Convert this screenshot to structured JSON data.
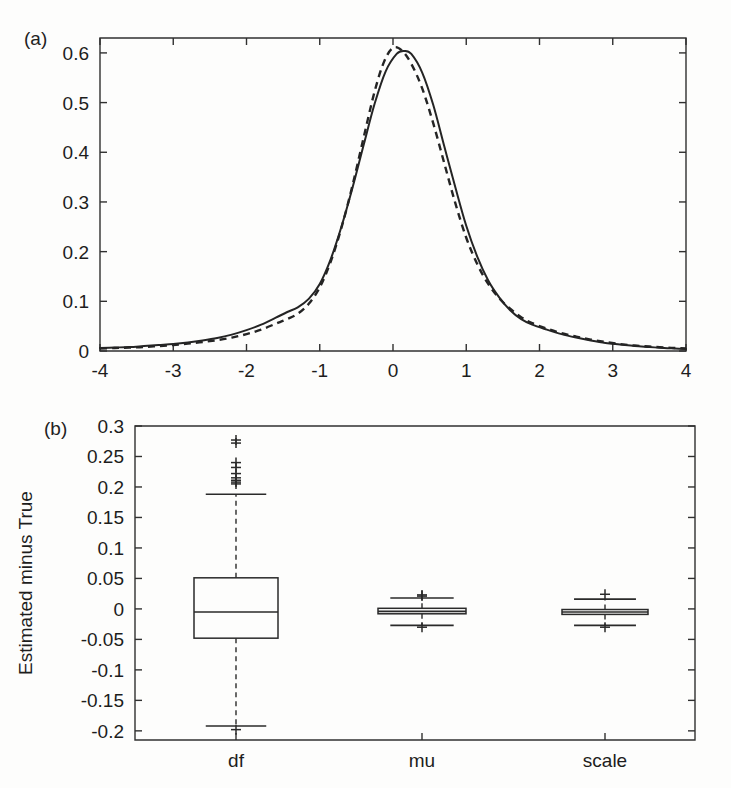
{
  "figure": {
    "panel_a_label": "(a)",
    "panel_b_label": "(b)"
  },
  "chart_data": [
    {
      "type": "line",
      "panel": "(a)",
      "title": "",
      "xlabel": "",
      "ylabel": "",
      "xlim": [
        -4,
        4
      ],
      "ylim": [
        0,
        0.63
      ],
      "xticks": [
        -4,
        -3,
        -2,
        -1,
        0,
        1,
        2,
        3,
        4
      ],
      "xticklabels": [
        "-4",
        "-3",
        "-2",
        "-1",
        "0",
        "1",
        "2",
        "3",
        "4"
      ],
      "yticks": [
        0,
        0.1,
        0.2,
        0.3,
        0.4,
        0.5,
        0.6
      ],
      "yticklabels": [
        "0",
        "0.1",
        "0.2",
        "0.3",
        "0.4",
        "0.5",
        "0.6"
      ],
      "grid": false,
      "legend": "none",
      "series": [
        {
          "name": "estimated-density-solid",
          "style": "solid",
          "x": [
            -4.0,
            -3.8,
            -3.6,
            -3.4,
            -3.2,
            -3.0,
            -2.8,
            -2.6,
            -2.4,
            -2.2,
            -2.0,
            -1.8,
            -1.6,
            -1.45,
            -1.3,
            -1.15,
            -1.0,
            -0.85,
            -0.7,
            -0.55,
            -0.4,
            -0.25,
            -0.1,
            0.05,
            0.15,
            0.25,
            0.4,
            0.55,
            0.7,
            0.85,
            1.0,
            1.15,
            1.3,
            1.45,
            1.6,
            1.75,
            1.9,
            2.1,
            2.3,
            2.5,
            2.7,
            2.9,
            3.1,
            3.3,
            3.5,
            3.7,
            3.85,
            4.0
          ],
          "y": [
            0.006,
            0.007,
            0.008,
            0.01,
            0.012,
            0.014,
            0.017,
            0.021,
            0.026,
            0.033,
            0.042,
            0.053,
            0.067,
            0.078,
            0.088,
            0.105,
            0.135,
            0.185,
            0.252,
            0.33,
            0.415,
            0.498,
            0.563,
            0.598,
            0.604,
            0.598,
            0.56,
            0.495,
            0.412,
            0.33,
            0.252,
            0.19,
            0.142,
            0.108,
            0.082,
            0.064,
            0.053,
            0.043,
            0.034,
            0.027,
            0.021,
            0.016,
            0.013,
            0.01,
            0.008,
            0.006,
            0.005,
            0.004
          ]
        },
        {
          "name": "true-density-dashed",
          "style": "dashed",
          "x": [
            -4.0,
            -3.8,
            -3.6,
            -3.4,
            -3.2,
            -3.0,
            -2.8,
            -2.6,
            -2.4,
            -2.2,
            -2.0,
            -1.8,
            -1.6,
            -1.45,
            -1.3,
            -1.15,
            -1.0,
            -0.85,
            -0.7,
            -0.55,
            -0.4,
            -0.25,
            -0.12,
            0.0,
            0.12,
            0.25,
            0.4,
            0.55,
            0.7,
            0.85,
            1.0,
            1.15,
            1.3,
            1.45,
            1.6,
            1.75,
            1.9,
            2.1,
            2.3,
            2.5,
            2.7,
            2.9,
            3.1,
            3.3,
            3.5,
            3.7,
            3.85,
            4.0
          ],
          "y": [
            0.005,
            0.006,
            0.007,
            0.008,
            0.01,
            0.012,
            0.015,
            0.018,
            0.022,
            0.027,
            0.034,
            0.043,
            0.055,
            0.064,
            0.075,
            0.095,
            0.128,
            0.18,
            0.25,
            0.335,
            0.43,
            0.523,
            0.583,
            0.61,
            0.605,
            0.578,
            0.528,
            0.458,
            0.378,
            0.298,
            0.228,
            0.175,
            0.135,
            0.106,
            0.085,
            0.068,
            0.056,
            0.045,
            0.036,
            0.029,
            0.023,
            0.018,
            0.014,
            0.011,
            0.009,
            0.007,
            0.006,
            0.005
          ]
        }
      ]
    },
    {
      "type": "boxplot",
      "panel": "(b)",
      "title": "",
      "xlabel": "",
      "ylabel": "Estimated minus True",
      "ylim": [
        -0.215,
        0.3
      ],
      "yticks": [
        0.3,
        0.25,
        0.2,
        0.15,
        0.1,
        0.05,
        0,
        -0.05,
        -0.1,
        -0.15,
        -0.2
      ],
      "yticklabels": [
        "0.3",
        "0.25",
        "0.2",
        "0.15",
        "0.1",
        "0.05",
        "0",
        "-0.05",
        "-0.1",
        "-0.15",
        "-0.2"
      ],
      "categories": [
        "df",
        "mu",
        "scale"
      ],
      "grid": false,
      "legend": "none",
      "boxes": [
        {
          "name": "df",
          "q1": -0.048,
          "median": -0.005,
          "q3": 0.051,
          "whisker_low": -0.192,
          "whisker_high": 0.188,
          "outliers_high": [
            0.277,
            0.272,
            0.24,
            0.232,
            0.222,
            0.215,
            0.211,
            0.208,
            0.205
          ],
          "outliers_low": [
            -0.198
          ]
        },
        {
          "name": "mu",
          "q1": -0.008,
          "median": -0.004,
          "q3": 0.001,
          "whisker_low": -0.027,
          "whisker_high": 0.018,
          "outliers_high": [
            0.021,
            0.023
          ],
          "outliers_low": [
            -0.03
          ]
        },
        {
          "name": "scale",
          "q1": -0.009,
          "median": -0.005,
          "q3": -0.001,
          "whisker_low": -0.027,
          "whisker_high": 0.016,
          "outliers_high": [
            0.024
          ],
          "outliers_low": [
            -0.03
          ]
        }
      ]
    }
  ]
}
